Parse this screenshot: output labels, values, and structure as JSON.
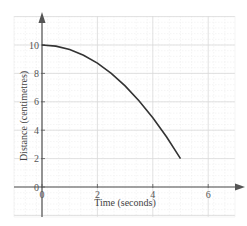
{
  "chart_data": {
    "type": "line",
    "title": "",
    "xlabel": "Time (seconds)",
    "ylabel": "Distance (centimetres)",
    "xlim": [
      0,
      7
    ],
    "ylim": [
      0,
      11
    ],
    "x_ticks": [
      "0",
      "2",
      "4",
      "6"
    ],
    "y_ticks": [
      "0",
      "2",
      "4",
      "6",
      "8",
      "10"
    ],
    "grid": true,
    "legend": null,
    "series": [
      {
        "name": "distance",
        "x": [
          0,
          0.5,
          1,
          1.5,
          2,
          2.5,
          3,
          3.5,
          4,
          4.5,
          5
        ],
        "values": [
          10,
          9.92,
          9.68,
          9.28,
          8.72,
          8.0,
          7.12,
          6.08,
          4.88,
          3.52,
          2.0
        ]
      }
    ],
    "colors": {
      "curve": "#333333",
      "axis": "#555555",
      "grid_major": "#d9d9d9",
      "grid_minor": "#eeeeee"
    }
  }
}
